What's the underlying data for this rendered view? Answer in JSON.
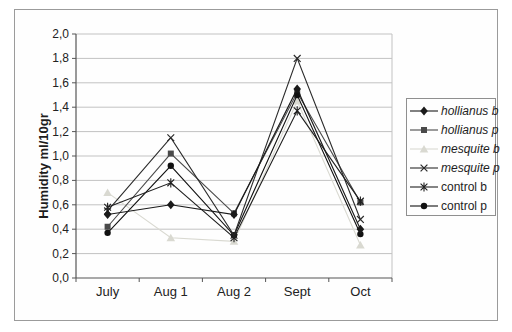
{
  "chart_data": {
    "type": "line",
    "title": "",
    "xlabel": "",
    "ylabel": "Humidity ml/10gr",
    "ylim": [
      0,
      2
    ],
    "ytick_step": 0.2,
    "decimal_separator": ",",
    "ytick_labels": [
      "0,0",
      "0,2",
      "0,4",
      "0,6",
      "0,8",
      "1,0",
      "1,2",
      "1,4",
      "1,6",
      "1,8",
      "2,0"
    ],
    "categories": [
      "July",
      "Aug 1",
      "Aug 2",
      "Sept",
      "Oct"
    ],
    "series": [
      {
        "name": "hollianus b",
        "marker": "diamond",
        "italic": true,
        "color": "#1a1a1a",
        "values": [
          0.52,
          0.6,
          0.52,
          1.55,
          0.4
        ]
      },
      {
        "name": "hollianus p",
        "marker": "square",
        "italic": true,
        "color": "#4a4a4a",
        "values": [
          0.42,
          1.02,
          0.53,
          1.52,
          0.62
        ]
      },
      {
        "name": "mesquite b",
        "marker": "triangle",
        "italic": true,
        "color": "#d9d9d1",
        "values": [
          0.7,
          0.33,
          0.3,
          1.45,
          0.27
        ]
      },
      {
        "name": "mesquite p",
        "marker": "x",
        "italic": true,
        "color": "#2b2b2b",
        "values": [
          0.55,
          1.15,
          0.35,
          1.8,
          0.48
        ]
      },
      {
        "name": "control b",
        "marker": "star",
        "italic": false,
        "color": "#1f1f1f",
        "values": [
          0.58,
          0.78,
          0.33,
          1.37,
          0.63
        ]
      },
      {
        "name": "control p",
        "marker": "circle",
        "italic": false,
        "color": "#111111",
        "values": [
          0.37,
          0.92,
          0.35,
          1.5,
          0.36
        ]
      }
    ],
    "legend_position": "right",
    "grid": "horizontal"
  },
  "style_colors": {
    "gridline": "#c2c2c2",
    "axis": "#555555",
    "tick_label": "#222222",
    "frame_border": "#9b9b9b",
    "background": "#ffffff"
  }
}
